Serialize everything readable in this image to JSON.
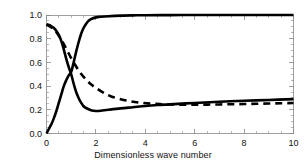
{
  "chart_data": {
    "type": "line",
    "title": "",
    "xlabel": "Dimensionless wave number",
    "ylabel": "Dimensionless group velocity",
    "xlim": [
      0,
      10
    ],
    "ylim": [
      0.0,
      1.0
    ],
    "xticks": [
      0,
      2,
      4,
      6,
      8,
      10
    ],
    "xtick_labels": [
      "0",
      "2",
      "4",
      "6",
      "8",
      "10"
    ],
    "yticks": [
      0.0,
      0.2,
      0.4,
      0.6,
      0.8,
      1.0
    ],
    "ytick_labels": [
      "0.0",
      "0.2",
      "0.4",
      "0.6",
      "0.8",
      "1.0"
    ],
    "grid": false,
    "legend": "none",
    "line_color": "#000000",
    "series": [
      {
        "name": "upper-branch-solid",
        "style": "solid",
        "color": "#000000",
        "x": [
          0.0,
          0.1,
          0.2,
          0.3,
          0.4,
          0.5,
          0.6,
          0.7,
          0.8,
          0.9,
          1.0,
          1.1,
          1.2,
          1.3,
          1.4,
          1.5,
          1.6,
          1.7,
          1.8,
          2.0,
          2.2,
          2.5,
          3.0,
          3.5,
          4.0,
          5.0,
          6.0,
          7.0,
          8.0,
          9.0,
          10.0
        ],
        "y": [
          0.0,
          0.04,
          0.08,
          0.13,
          0.19,
          0.26,
          0.33,
          0.4,
          0.45,
          0.49,
          0.52,
          0.6,
          0.69,
          0.77,
          0.84,
          0.89,
          0.925,
          0.95,
          0.965,
          0.98,
          0.985,
          0.99,
          0.995,
          0.997,
          0.998,
          0.999,
          1.0,
          1.0,
          1.0,
          1.0,
          1.0
        ]
      },
      {
        "name": "lower-branch-solid",
        "style": "solid",
        "color": "#000000",
        "x": [
          0.0,
          0.1,
          0.2,
          0.3,
          0.4,
          0.5,
          0.6,
          0.7,
          0.8,
          0.9,
          1.0,
          1.1,
          1.2,
          1.3,
          1.4,
          1.5,
          1.6,
          1.8,
          2.0,
          2.2,
          2.5,
          3.0,
          3.5,
          4.0,
          4.5,
          5.0,
          6.0,
          7.0,
          8.0,
          9.0,
          10.0
        ],
        "y": [
          0.92,
          0.915,
          0.905,
          0.89,
          0.865,
          0.83,
          0.78,
          0.71,
          0.63,
          0.56,
          0.5,
          0.42,
          0.35,
          0.3,
          0.26,
          0.23,
          0.215,
          0.197,
          0.19,
          0.192,
          0.2,
          0.212,
          0.222,
          0.232,
          0.24,
          0.246,
          0.258,
          0.268,
          0.276,
          0.283,
          0.29
        ]
      },
      {
        "name": "dashed-branch",
        "style": "dashed",
        "color": "#000000",
        "x": [
          0.0,
          0.2,
          0.4,
          0.6,
          0.8,
          1.0,
          1.2,
          1.4,
          1.6,
          1.8,
          2.0,
          2.3,
          2.6,
          3.0,
          3.4,
          3.8,
          4.2,
          4.6,
          5.0,
          5.5,
          6.0,
          6.5,
          7.0,
          7.5,
          8.0,
          8.5,
          9.0,
          9.5,
          10.0
        ],
        "y": [
          0.92,
          0.895,
          0.855,
          0.79,
          0.715,
          0.635,
          0.565,
          0.505,
          0.455,
          0.415,
          0.385,
          0.345,
          0.315,
          0.29,
          0.272,
          0.26,
          0.252,
          0.248,
          0.245,
          0.243,
          0.243,
          0.244,
          0.245,
          0.247,
          0.249,
          0.251,
          0.253,
          0.255,
          0.257
        ]
      }
    ]
  },
  "figure": {
    "background": "#ffffff",
    "axis_color": "#888888"
  }
}
